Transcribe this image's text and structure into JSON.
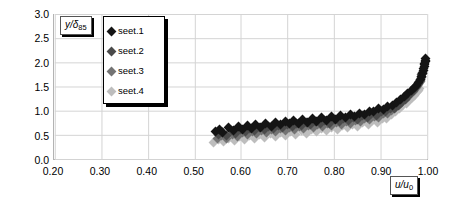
{
  "chart_data": {
    "type": "scatter",
    "title": "",
    "xlabel": "u/u0",
    "ylabel": "y/d85",
    "xlabel_html": "u/u<sub>0</sub>",
    "ylabel_html": "y/δ<sub>85</sub>",
    "xlim": [
      0.2,
      1.0
    ],
    "ylim": [
      0.0,
      3.0
    ],
    "xticks": [
      "0.20",
      "0.30",
      "0.40",
      "0.50",
      "0.60",
      "0.70",
      "0.80",
      "0.90",
      "1.00"
    ],
    "yticks": [
      "0.0",
      "0.5",
      "1.0",
      "1.5",
      "2.0",
      "2.5",
      "3.0"
    ],
    "grid": true,
    "legend_position": "upper-left-inside",
    "marker": "diamond",
    "series": [
      {
        "name": "seet.1",
        "color": "#141414",
        "x": [
          0.545,
          0.552,
          0.56,
          0.572,
          0.583,
          0.594,
          0.603,
          0.612,
          0.621,
          0.63,
          0.641,
          0.652,
          0.663,
          0.673,
          0.683,
          0.693,
          0.702,
          0.711,
          0.721,
          0.731,
          0.741,
          0.751,
          0.761,
          0.771,
          0.781,
          0.791,
          0.801,
          0.812,
          0.822,
          0.832,
          0.842,
          0.852,
          0.862,
          0.872,
          0.882,
          0.892,
          0.902,
          0.912,
          0.922,
          0.931,
          0.94,
          0.948,
          0.955,
          0.962,
          0.968,
          0.973,
          0.977,
          0.981,
          0.984,
          0.986,
          0.988,
          0.989,
          0.99,
          0.991,
          0.991,
          0.992,
          0.992,
          0.992
        ],
        "y": [
          0.58,
          0.62,
          0.56,
          0.66,
          0.6,
          0.68,
          0.63,
          0.71,
          0.65,
          0.72,
          0.67,
          0.74,
          0.69,
          0.77,
          0.72,
          0.79,
          0.74,
          0.81,
          0.76,
          0.83,
          0.78,
          0.85,
          0.8,
          0.87,
          0.82,
          0.89,
          0.84,
          0.91,
          0.87,
          0.93,
          0.9,
          0.96,
          0.94,
          1.0,
          0.99,
          1.05,
          1.04,
          1.1,
          1.11,
          1.18,
          1.24,
          1.3,
          1.36,
          1.42,
          1.48,
          1.54,
          1.6,
          1.66,
          1.72,
          1.78,
          1.83,
          1.88,
          1.92,
          1.96,
          1.99,
          2.02,
          2.05,
          2.08
        ]
      },
      {
        "name": "seet.2",
        "color": "#4a4a4a",
        "x": [
          0.55,
          0.559,
          0.568,
          0.578,
          0.588,
          0.598,
          0.608,
          0.618,
          0.628,
          0.638,
          0.648,
          0.658,
          0.668,
          0.678,
          0.688,
          0.698,
          0.708,
          0.718,
          0.728,
          0.738,
          0.748,
          0.758,
          0.768,
          0.778,
          0.788,
          0.798,
          0.808,
          0.818,
          0.828,
          0.838,
          0.848,
          0.858,
          0.868,
          0.878,
          0.888,
          0.898,
          0.908,
          0.917,
          0.926,
          0.934,
          0.942,
          0.949,
          0.955,
          0.961,
          0.966,
          0.97,
          0.974,
          0.977,
          0.979,
          0.981,
          0.983,
          0.984,
          0.985,
          0.986,
          0.986
        ],
        "y": [
          0.52,
          0.57,
          0.51,
          0.6,
          0.55,
          0.63,
          0.58,
          0.65,
          0.6,
          0.67,
          0.62,
          0.69,
          0.64,
          0.71,
          0.66,
          0.73,
          0.68,
          0.75,
          0.7,
          0.77,
          0.72,
          0.79,
          0.74,
          0.81,
          0.76,
          0.83,
          0.79,
          0.85,
          0.81,
          0.88,
          0.84,
          0.91,
          0.87,
          0.95,
          0.92,
          1.0,
          0.99,
          1.06,
          1.06,
          1.13,
          1.19,
          1.25,
          1.31,
          1.37,
          1.42,
          1.47,
          1.52,
          1.57,
          1.61,
          1.65,
          1.69,
          1.72,
          1.75,
          1.77,
          1.79
        ]
      },
      {
        "name": "seet.3",
        "color": "#737373",
        "x": [
          0.548,
          0.558,
          0.569,
          0.58,
          0.591,
          0.602,
          0.613,
          0.623,
          0.633,
          0.643,
          0.653,
          0.663,
          0.673,
          0.683,
          0.693,
          0.703,
          0.713,
          0.723,
          0.733,
          0.743,
          0.753,
          0.763,
          0.773,
          0.783,
          0.793,
          0.803,
          0.813,
          0.823,
          0.833,
          0.843,
          0.853,
          0.863,
          0.873,
          0.883,
          0.893,
          0.902,
          0.911,
          0.92,
          0.928,
          0.936,
          0.943,
          0.95,
          0.956,
          0.961,
          0.966,
          0.97,
          0.973,
          0.976,
          0.978,
          0.98,
          0.981,
          0.982
        ],
        "y": [
          0.45,
          0.5,
          0.45,
          0.53,
          0.49,
          0.56,
          0.52,
          0.58,
          0.54,
          0.6,
          0.56,
          0.62,
          0.58,
          0.64,
          0.6,
          0.66,
          0.62,
          0.68,
          0.64,
          0.7,
          0.66,
          0.72,
          0.68,
          0.74,
          0.71,
          0.77,
          0.73,
          0.79,
          0.76,
          0.82,
          0.79,
          0.85,
          0.83,
          0.9,
          0.88,
          0.96,
          0.96,
          1.02,
          1.08,
          1.14,
          1.2,
          1.26,
          1.31,
          1.36,
          1.41,
          1.45,
          1.49,
          1.53,
          1.56,
          1.59,
          1.61,
          1.63
        ]
      },
      {
        "name": "seet.4",
        "color": "#bdbdbd",
        "x": [
          0.54,
          0.551,
          0.562,
          0.573,
          0.584,
          0.595,
          0.606,
          0.617,
          0.628,
          0.639,
          0.65,
          0.661,
          0.672,
          0.683,
          0.694,
          0.705,
          0.716,
          0.727,
          0.738,
          0.749,
          0.76,
          0.771,
          0.782,
          0.793,
          0.804,
          0.815,
          0.826,
          0.837,
          0.848,
          0.859,
          0.87,
          0.88,
          0.89,
          0.9,
          0.91,
          0.919,
          0.928,
          0.936,
          0.944,
          0.951,
          0.957,
          0.963,
          0.968,
          0.972,
          0.975,
          0.978,
          0.98
        ],
        "y": [
          0.36,
          0.42,
          0.37,
          0.45,
          0.4,
          0.48,
          0.43,
          0.5,
          0.45,
          0.52,
          0.47,
          0.54,
          0.49,
          0.56,
          0.51,
          0.58,
          0.53,
          0.6,
          0.55,
          0.62,
          0.58,
          0.64,
          0.6,
          0.67,
          0.63,
          0.7,
          0.66,
          0.73,
          0.69,
          0.77,
          0.73,
          0.81,
          0.78,
          0.86,
          0.85,
          0.93,
          0.99,
          1.05,
          1.11,
          1.17,
          1.22,
          1.27,
          1.32,
          1.36,
          1.4,
          1.43,
          1.46
        ]
      }
    ]
  }
}
